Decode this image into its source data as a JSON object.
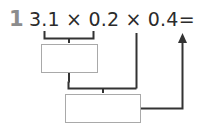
{
  "worksheet": {
    "problem_number": "1",
    "equation": "3.1 × 0.2 × 0.4=",
    "equation_parts": {
      "factor_1": "3.1",
      "operator_1": "×",
      "factor_2": "0.2",
      "operator_2": "×",
      "factor_3": "0.4",
      "equals": "="
    },
    "answer_box_1_value": "",
    "answer_box_2_value": "",
    "colors": {
      "problem_number": "#8c8c8c",
      "equation_text": "#2b2b2b",
      "box_border": "#a9a9a9",
      "connector_line": "#333333",
      "background": "#ffffff"
    },
    "annotations": {
      "brace_1_label": "groups 3.1 and 0.2 into first answer box",
      "brace_2_label": "groups first answer box result with 0.4 into second answer box",
      "arrow_label": "result arrow pointing up to final answer"
    }
  }
}
